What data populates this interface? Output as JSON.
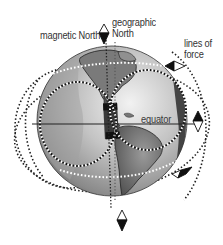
{
  "diagram": {
    "labels": {
      "magnetic_north": "magnetic North",
      "geographic_north_line1": "geographic",
      "geographic_north_line2": "North",
      "lines_of_force_line1": "lines of",
      "lines_of_force_line2": "force",
      "equator": "equator"
    },
    "icons": [
      "compass-needle-icon"
    ],
    "colors": {
      "background": "#ffffff",
      "ocean_dark": "#5a5a5a",
      "ocean_light": "#d8d8d8",
      "land": "#6e6e6e",
      "lines": "#222222",
      "text": "#333333"
    }
  }
}
